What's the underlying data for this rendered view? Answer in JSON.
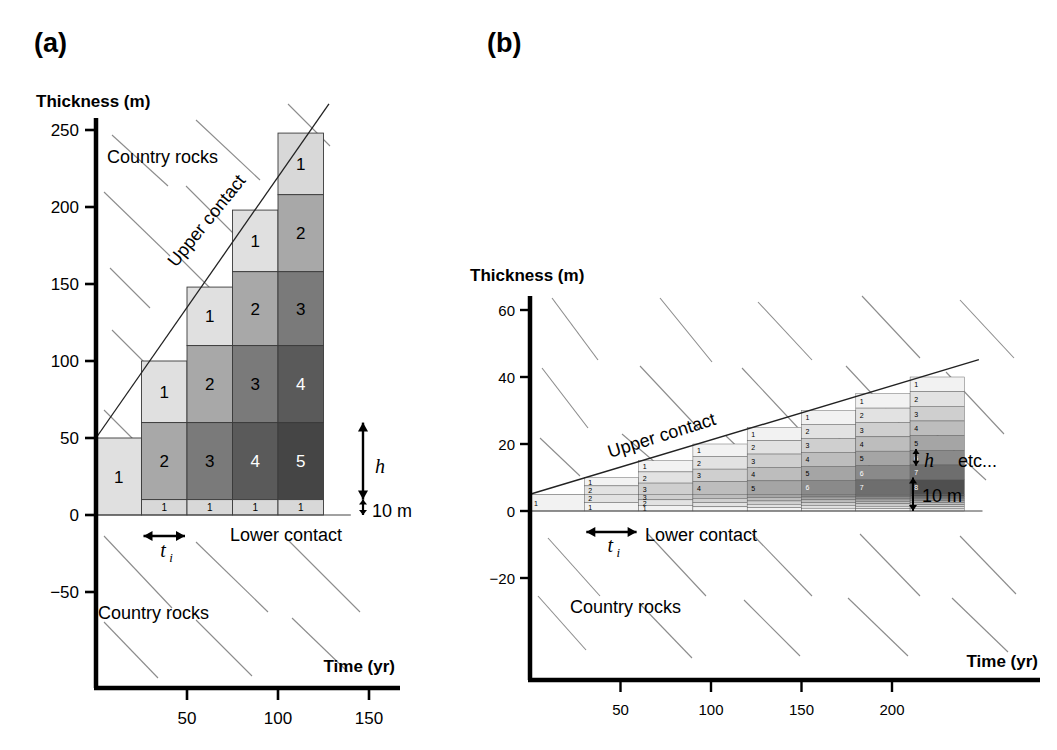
{
  "figure": {
    "domain": "chart",
    "panels": [
      "a",
      "b"
    ]
  },
  "panel_a": {
    "label": "(a)",
    "ylabel": "Thickness (m)",
    "xlabel": "Time (yr)",
    "yticks": [
      250,
      200,
      150,
      100,
      50,
      0,
      -50
    ],
    "xticks": [
      50,
      100,
      150
    ],
    "annotations": {
      "country_rocks_top": "Country rocks",
      "country_rocks_bottom": "Country rocks",
      "upper_contact": "Upper contact",
      "lower_contact": "Lower contact",
      "h_label": "h",
      "ti_label": "t",
      "ti_sub": "i",
      "scale_label": "10 m"
    }
  },
  "panel_b": {
    "label": "(b)",
    "ylabel": "Thickness (m)",
    "xlabel": "Time (yr)",
    "yticks": [
      60,
      40,
      20,
      0,
      -20
    ],
    "xticks": [
      50,
      100,
      150,
      200
    ],
    "annotations": {
      "country_rocks": "Country rocks",
      "upper_contact": "Upper contact",
      "lower_contact": "Lower contact",
      "h_label": "h",
      "ti_label": "t",
      "ti_sub": "i",
      "scale_label": "10 m",
      "etc_label": "etc..."
    }
  },
  "chart_data": {
    "type": "bar",
    "xlabel": "Time (yr)",
    "ylabel": "Thickness (m)",
    "panels": [
      {
        "name": "a",
        "xlim": [
          0,
          170
        ],
        "ylim": [
          -70,
          265
        ],
        "xticks": [
          50,
          100,
          150
        ],
        "yticks": [
          250,
          200,
          150,
          100,
          50,
          0,
          -50
        ],
        "grid": false,
        "injection_interval_yr": 25,
        "layer_thickness_h_m": 50,
        "basal_layer_m": 10,
        "columns": [
          {
            "t_start": 0,
            "t_end": 25,
            "top_m": 50,
            "layers": [
              {
                "n": "1",
                "from": 0,
                "to": 50,
                "gray": "#e0e0e0"
              }
            ]
          },
          {
            "t_start": 25,
            "t_end": 50,
            "top_m": 100,
            "layers": [
              {
                "n": "1",
                "from": 60,
                "to": 100,
                "gray": "#e0e0e0"
              },
              {
                "n": "2",
                "from": 10,
                "to": 60,
                "gray": "#a8a8a8"
              },
              {
                "n": "1",
                "from": 0,
                "to": 10,
                "gray": "#d8d8d8"
              }
            ]
          },
          {
            "t_start": 50,
            "t_end": 75,
            "top_m": 148,
            "layers": [
              {
                "n": "1",
                "from": 110,
                "to": 148,
                "gray": "#e0e0e0"
              },
              {
                "n": "2",
                "from": 60,
                "to": 110,
                "gray": "#a8a8a8"
              },
              {
                "n": "3",
                "from": 10,
                "to": 60,
                "gray": "#7a7a7a"
              },
              {
                "n": "1",
                "from": 0,
                "to": 10,
                "gray": "#d8d8d8"
              }
            ]
          },
          {
            "t_start": 75,
            "t_end": 100,
            "top_m": 198,
            "layers": [
              {
                "n": "1",
                "from": 158,
                "to": 198,
                "gray": "#e0e0e0"
              },
              {
                "n": "2",
                "from": 110,
                "to": 158,
                "gray": "#a8a8a8"
              },
              {
                "n": "3",
                "from": 60,
                "to": 110,
                "gray": "#7a7a7a"
              },
              {
                "n": "4",
                "from": 10,
                "to": 60,
                "gray": "#5a5a5a"
              },
              {
                "n": "1",
                "from": 0,
                "to": 10,
                "gray": "#d8d8d8"
              }
            ]
          },
          {
            "t_start": 100,
            "t_end": 125,
            "top_m": 248,
            "layers": [
              {
                "n": "1",
                "from": 208,
                "to": 248,
                "gray": "#d8d8d8"
              },
              {
                "n": "2",
                "from": 158,
                "to": 208,
                "gray": "#a8a8a8"
              },
              {
                "n": "3",
                "from": 110,
                "to": 158,
                "gray": "#7a7a7a"
              },
              {
                "n": "4",
                "from": 60,
                "to": 110,
                "gray": "#5a5a5a"
              },
              {
                "n": "5",
                "from": 10,
                "to": 60,
                "gray": "#454545"
              },
              {
                "n": "1",
                "from": 0,
                "to": 10,
                "gray": "#d8d8d8"
              }
            ]
          }
        ],
        "upper_contact_line": {
          "x0_yr": 0,
          "y0_m": 50,
          "x1_yr": 125,
          "y1_m": 262
        },
        "lower_contact_m": 0
      },
      {
        "name": "b",
        "xlim": [
          0,
          240
        ],
        "ylim": [
          -32,
          68
        ],
        "xticks": [
          50,
          100,
          150,
          200
        ],
        "yticks": [
          60,
          40,
          20,
          0,
          -20
        ],
        "grid": false,
        "injection_interval_yr": 30,
        "layer_thickness_h_m": 2.5,
        "basal_layer_m": 5,
        "columns": [
          {
            "t_start": 0,
            "t_end": 30,
            "top_m": 5,
            "n_layers": 1
          },
          {
            "t_start": 30,
            "t_end": 60,
            "top_m": 10,
            "n_layers": 2
          },
          {
            "t_start": 60,
            "t_end": 90,
            "top_m": 15,
            "n_layers": 3
          },
          {
            "t_start": 90,
            "t_end": 120,
            "top_m": 20,
            "n_layers": 4
          },
          {
            "t_start": 120,
            "t_end": 150,
            "top_m": 25,
            "n_layers": 5
          },
          {
            "t_start": 150,
            "t_end": 180,
            "top_m": 30,
            "n_layers": 6
          },
          {
            "t_start": 180,
            "t_end": 210,
            "top_m": 35,
            "n_layers": 7
          },
          {
            "t_start": 210,
            "t_end": 240,
            "top_m": 40,
            "n_layers": 8
          }
        ],
        "upper_contact_line": {
          "x0_yr": 0,
          "y0_m": 5,
          "x1_yr": 240,
          "y1_m": 44
        },
        "lower_contact_m": 0
      }
    ]
  }
}
